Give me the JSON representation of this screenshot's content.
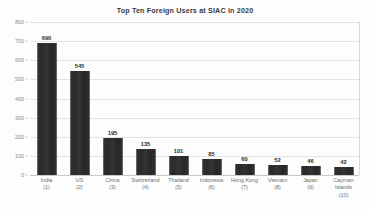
{
  "chart_data": {
    "type": "bar",
    "title": "Top Ten Foreign Users at SIAC in 2020",
    "xlabel": "",
    "ylabel": "",
    "ylim": [
      0,
      800
    ],
    "ytick_step": 100,
    "yticks": [
      "800",
      "700",
      "600",
      "500",
      "400",
      "300",
      "200",
      "100",
      "0"
    ],
    "grid": true,
    "legend": "none",
    "bar_color": "#2c2c2c",
    "categories": [
      "India",
      "US",
      "China",
      "Switzerland",
      "Thailand",
      "Indonesia",
      "Hong Kong",
      "Vietnam",
      "Japan",
      "Cayman Islands"
    ],
    "rank_labels": [
      "(1)",
      "(2)",
      "(3)",
      "(4)",
      "(5)",
      "(6)",
      "(7)",
      "(8)",
      "(9)",
      "(10)"
    ],
    "values": [
      690,
      545,
      195,
      135,
      101,
      85,
      60,
      52,
      46,
      42
    ],
    "value_labels": [
      "690",
      "545",
      "195",
      "135",
      "101",
      "85",
      "60",
      "52",
      "46",
      "42"
    ]
  }
}
